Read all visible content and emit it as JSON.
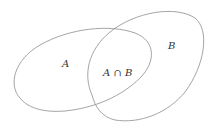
{
  "diagram": {
    "type": "venn",
    "sets": [
      {
        "id": "A",
        "label": "A"
      },
      {
        "id": "B",
        "label": "B"
      }
    ],
    "intersection": {
      "label": "A ∩ B"
    },
    "colors": {
      "outline": "#9a9a9a",
      "text": "#333333",
      "background": "#ffffff"
    }
  }
}
